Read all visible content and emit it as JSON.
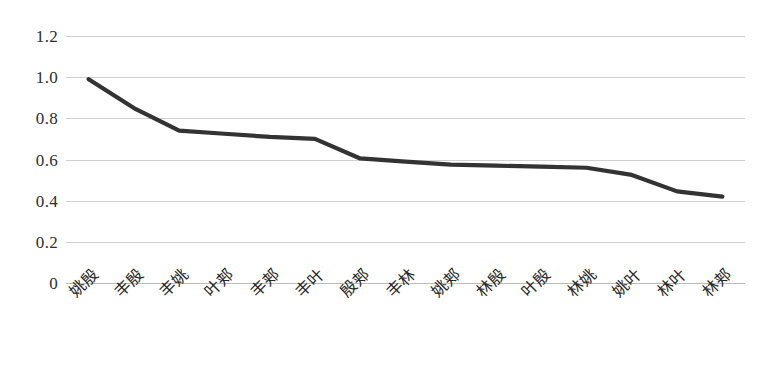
{
  "chart_data": {
    "type": "line",
    "title": "",
    "subtitle": "",
    "xlabel": "",
    "ylabel": "",
    "ylim": [
      0,
      1.2
    ],
    "ytick_labels": [
      "1.2",
      "1.0",
      "0.8",
      "0.6",
      "0.4",
      "0.2",
      "0"
    ],
    "ytick_values": [
      1.2,
      1.0,
      0.8,
      0.6,
      0.4,
      0.2,
      0
    ],
    "grid": true,
    "legend": false,
    "legend_position": "none",
    "categories": [
      "姚殷",
      "丰殷",
      "丰姚",
      "叶郏",
      "丰郏",
      "丰叶",
      "殷郏",
      "丰林",
      "姚郏",
      "林殷",
      "叶殷",
      "林姚",
      "姚叶",
      "林叶",
      "林郏"
    ],
    "values": [
      0.99,
      0.85,
      0.74,
      0.725,
      0.71,
      0.7,
      0.605,
      0.59,
      0.575,
      0.57,
      0.565,
      0.56,
      0.525,
      0.445,
      0.42
    ],
    "series": [
      {
        "name": "",
        "values": [
          0.99,
          0.85,
          0.74,
          0.725,
          0.71,
          0.7,
          0.605,
          0.59,
          0.575,
          0.57,
          0.565,
          0.56,
          0.525,
          0.445,
          0.42
        ]
      }
    ],
    "colors": {
      "line": "#333333",
      "gridline": "#d0d0d0",
      "axis": "#bcbcbc",
      "tick_text": "#2e2e2e",
      "background": "#ffffff"
    },
    "line_width": 4.2
  }
}
